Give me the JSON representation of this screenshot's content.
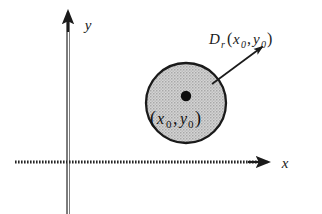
{
  "figure": {
    "background_color": "#ffffff",
    "ink_color": "#1b1b1b"
  },
  "axes": {
    "x_label": "x",
    "y_label": "y",
    "x_axis_name": "horizontal-axis",
    "y_axis_name": "vertical-axis",
    "origin": {
      "x": 68,
      "y": 162
    },
    "x_start": 15,
    "x_end": 268,
    "y_top": 12,
    "y_bottom": 214,
    "arrow_color": "#1b1b1b"
  },
  "disk": {
    "center": {
      "x": 186,
      "y": 103
    },
    "radius": 40,
    "fill_color": "#c9c9c9",
    "stroke_color": "#1a1a1a",
    "stroke_width": 2.2,
    "fill_pattern": "stipple",
    "label_main": "D",
    "label_subscript": "r",
    "label_open_paren": "(",
    "label_arg_x": "x",
    "label_arg_x_sub": "0",
    "label_comma": ",",
    "label_arg_y": "y",
    "label_arg_y_sub": "0",
    "label_close_paren": ")",
    "label_full": "D_r(x0, y0)"
  },
  "center_point": {
    "dot_color": "#0d0d0d",
    "dot_radius": 5.2,
    "dot_x": 186,
    "dot_y": 96,
    "label_open_paren": "(",
    "label_x": "x",
    "label_x_sub": "0",
    "label_comma": ",",
    "label_y": "y",
    "label_y_sub": "0",
    "label_close_paren": ")",
    "label_full": "(x0, y0)"
  },
  "leader_line": {
    "from_x": 260,
    "from_y": 48,
    "to_x": 212,
    "to_y": 84,
    "color": "#1b1b1b",
    "width": 1.6,
    "arrow_at": "start"
  }
}
